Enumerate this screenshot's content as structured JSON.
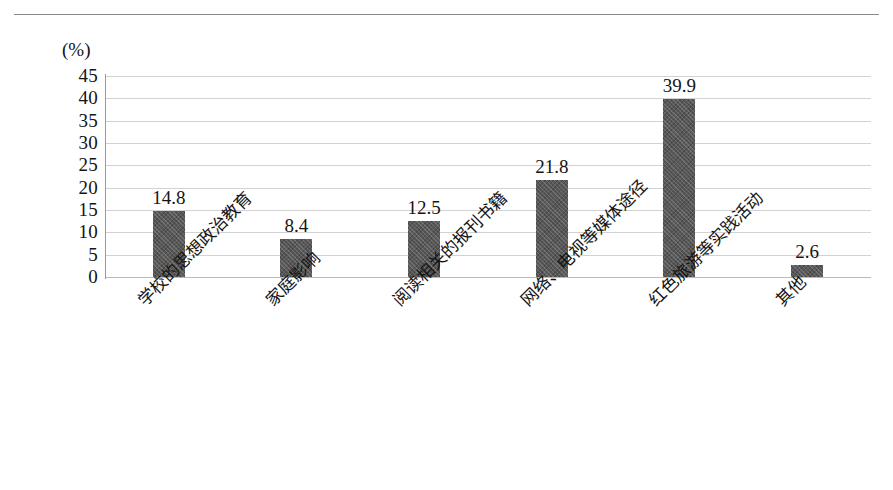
{
  "chart_data": {
    "type": "bar",
    "title": "",
    "xlabel": "",
    "ylabel": "(%)",
    "unit_label": "(%)",
    "categories": [
      "学校的思想政治教育",
      "家庭影响",
      "阅读相关的报刊书籍",
      "网络、电视等媒体途径",
      "红色旅游等实践活动",
      "其他"
    ],
    "values": [
      14.8,
      8.4,
      12.5,
      21.8,
      39.9,
      2.6
    ],
    "value_labels": [
      "14.8",
      "8.4",
      "12.5",
      "21.8",
      "39.9",
      "2.6"
    ],
    "ylim": [
      0,
      45
    ],
    "ytick_step": 5,
    "yticks": [
      "45",
      "40",
      "35",
      "30",
      "25",
      "20",
      "15",
      "10",
      "5",
      "0"
    ],
    "ytick_values": [
      45,
      40,
      35,
      30,
      25,
      20,
      15,
      10,
      5,
      0
    ],
    "grid": true,
    "legend": false,
    "legend_position": "none",
    "bar_color": "#585858",
    "gridline_color": "#d2d2d2",
    "axis_color": "#9a9a9a",
    "background_color": "#ffffff",
    "label_rotation": -45
  }
}
